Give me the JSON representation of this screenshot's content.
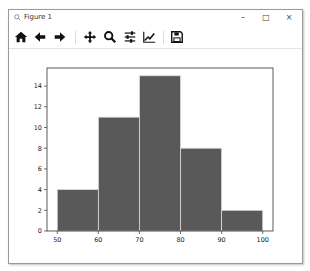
{
  "window": {
    "title": "Figure 1",
    "controls": {
      "minimize": "–",
      "maximize": "□",
      "close": "×"
    }
  },
  "toolbar": {
    "buttons": [
      {
        "name": "home",
        "icon": "home-icon",
        "tooltip": "Reset original view"
      },
      {
        "name": "back",
        "icon": "arrow-left-icon",
        "tooltip": "Back to previous view"
      },
      {
        "name": "forward",
        "icon": "arrow-right-icon",
        "tooltip": "Forward to next view"
      },
      {
        "name": "pan",
        "icon": "move-icon",
        "tooltip": "Pan axes"
      },
      {
        "name": "zoom",
        "icon": "magnifier-icon",
        "tooltip": "Zoom to rectangle"
      },
      {
        "name": "subplots",
        "icon": "sliders-icon",
        "tooltip": "Configure subplots"
      },
      {
        "name": "edit",
        "icon": "line-chart-icon",
        "tooltip": "Edit axis, curve and image parameters"
      },
      {
        "name": "save",
        "icon": "floppy-disk-icon",
        "tooltip": "Save the figure"
      }
    ]
  },
  "colors": {
    "bar_fill": "#595959",
    "bar_edge": "#dcdcdc",
    "axes": "#333333"
  },
  "chart_data": {
    "type": "bar",
    "subtype": "histogram",
    "title": "",
    "xlabel": "",
    "ylabel": "",
    "bin_edges": [
      50,
      60,
      70,
      80,
      90,
      100
    ],
    "categories": [
      "50-60",
      "60-70",
      "70-80",
      "80-90",
      "90-100"
    ],
    "values": [
      4,
      11,
      15,
      8,
      2
    ],
    "xlim": [
      47.5,
      102.5
    ],
    "ylim": [
      0,
      15.75
    ],
    "xticks": [
      50,
      60,
      70,
      80,
      90,
      100
    ],
    "yticks": [
      0,
      2,
      4,
      6,
      8,
      10,
      12,
      14
    ],
    "grid": false,
    "legend": null
  }
}
